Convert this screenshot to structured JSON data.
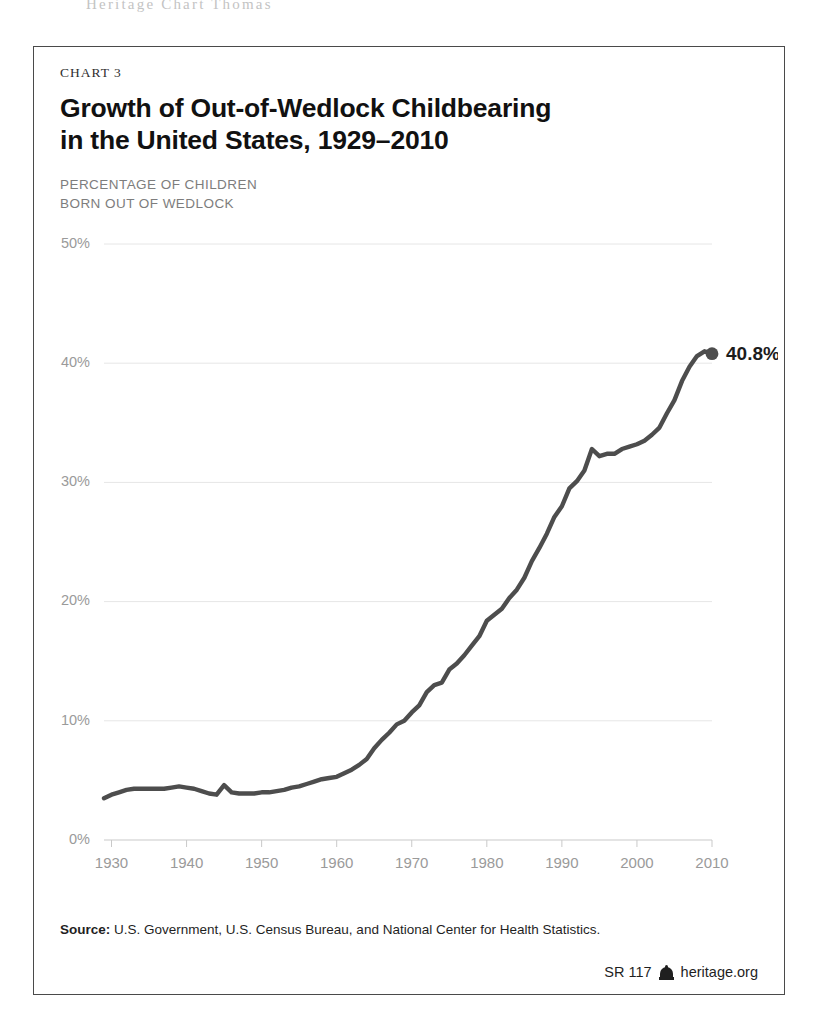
{
  "page": {
    "header_bleed": "Heritage Chart Thomas"
  },
  "card": {
    "kicker": "CHART 3",
    "title": "Growth of Out-of-Wedlock Childbearing in the United States, 1929–2010",
    "axis_caption": "PERCENTAGE OF CHILDREN\nBORN OUT OF WEDLOCK",
    "footer": {
      "source_label": "Source:",
      "source_text": " U.S. Government, U.S. Census Bureau, and National Center for Health Statistics.",
      "report_id": "SR 117",
      "logo_icon": "heritage-bell-icon",
      "site": "heritage.org"
    }
  },
  "chart_data": {
    "type": "line",
    "title": "Growth of Out-of-Wedlock Childbearing in the United States, 1929–2010",
    "subtitle": "CHART 3",
    "xlabel": "",
    "ylabel": "PERCENTAGE OF CHILDREN BORN OUT OF WEDLOCK",
    "xlim": [
      1929,
      2010
    ],
    "ylim": [
      0,
      50
    ],
    "yticks": [
      0,
      10,
      20,
      30,
      40,
      50
    ],
    "ytick_labels": [
      "0%",
      "10%",
      "20%",
      "30%",
      "40%",
      "50%"
    ],
    "xticks": [
      1930,
      1940,
      1950,
      1960,
      1970,
      1980,
      1990,
      2000,
      2010
    ],
    "xtick_labels": [
      "1930",
      "1940",
      "1950",
      "1960",
      "1970",
      "1980",
      "1990",
      "2000",
      "2010"
    ],
    "grid": true,
    "legend": false,
    "line_color": "#4d4d4d",
    "grid_color": "#e6e6e6",
    "tick_color": "#9a9a9a",
    "annotations": [
      {
        "x": 2010,
        "y": 40.8,
        "text": "40.8%",
        "marker": "dot"
      }
    ],
    "series": [
      {
        "name": "Percentage of children born out of wedlock",
        "x": [
          1929,
          1930,
          1931,
          1932,
          1933,
          1934,
          1935,
          1936,
          1937,
          1938,
          1939,
          1940,
          1941,
          1942,
          1943,
          1944,
          1945,
          1946,
          1947,
          1948,
          1949,
          1950,
          1951,
          1952,
          1953,
          1954,
          1955,
          1956,
          1957,
          1958,
          1959,
          1960,
          1961,
          1962,
          1963,
          1964,
          1965,
          1966,
          1967,
          1968,
          1969,
          1970,
          1971,
          1972,
          1973,
          1974,
          1975,
          1976,
          1977,
          1978,
          1979,
          1980,
          1981,
          1982,
          1983,
          1984,
          1985,
          1986,
          1987,
          1988,
          1989,
          1990,
          1991,
          1992,
          1993,
          1994,
          1995,
          1996,
          1997,
          1998,
          1999,
          2000,
          2001,
          2002,
          2003,
          2004,
          2005,
          2006,
          2007,
          2008,
          2009,
          2010
        ],
        "values": [
          3.5,
          3.8,
          4.0,
          4.2,
          4.3,
          4.3,
          4.3,
          4.3,
          4.3,
          4.4,
          4.5,
          4.4,
          4.3,
          4.1,
          3.9,
          3.8,
          4.6,
          4.0,
          3.9,
          3.9,
          3.9,
          4.0,
          4.0,
          4.1,
          4.2,
          4.4,
          4.5,
          4.7,
          4.9,
          5.1,
          5.2,
          5.3,
          5.6,
          5.9,
          6.3,
          6.8,
          7.7,
          8.4,
          9.0,
          9.7,
          10.0,
          10.7,
          11.3,
          12.4,
          13.0,
          13.2,
          14.3,
          14.8,
          15.5,
          16.3,
          17.1,
          18.4,
          18.9,
          19.4,
          20.3,
          21.0,
          22.0,
          23.4,
          24.5,
          25.7,
          27.1,
          28.0,
          29.5,
          30.1,
          31.0,
          32.8,
          32.2,
          32.4,
          32.4,
          32.8,
          33.0,
          33.2,
          33.5,
          34.0,
          34.6,
          35.8,
          36.9,
          38.5,
          39.7,
          40.6,
          41.0,
          40.8
        ]
      }
    ]
  }
}
